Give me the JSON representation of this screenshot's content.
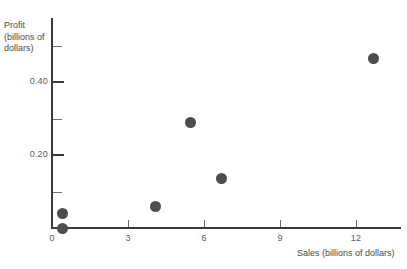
{
  "chart_data": {
    "type": "scatter",
    "title": "",
    "xlabel": "Sales (billions of dollars)",
    "ylabel": "Profit (billions of dollars)",
    "ylabel_lines": [
      "Profit",
      "(billions of",
      "dollars)"
    ],
    "xlim": [
      0,
      13.8
    ],
    "ylim": [
      0,
      0.575
    ],
    "xticks": [
      0,
      3,
      6,
      9,
      12
    ],
    "xticklabels": [
      "0",
      "3",
      "6",
      "9",
      "12"
    ],
    "yticks": [
      0.2,
      0.4
    ],
    "yticklabels": [
      "0.20",
      "0.40"
    ],
    "y_minor_ticks": [
      0.1,
      0.3,
      0.5
    ],
    "grid": false,
    "legend": null,
    "marker_color": "#4d4d4d",
    "axis_color": "#3a3a3a",
    "points": [
      {
        "x": 0.4,
        "y": 0.0
      },
      {
        "x": 0.4,
        "y": 0.04
      },
      {
        "x": 4.1,
        "y": 0.06
      },
      {
        "x": 5.45,
        "y": 0.29
      },
      {
        "x": 6.7,
        "y": 0.135
      },
      {
        "x": 12.7,
        "y": 0.465
      }
    ]
  }
}
